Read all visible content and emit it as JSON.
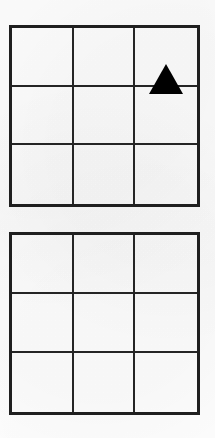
{
  "page": {
    "background_color": "#fefefe",
    "width": 215,
    "height": 438
  },
  "style": {
    "outer_border_color": "#1f1f1f",
    "inner_line_color": "#252525",
    "shape_color": "#000000",
    "outer_border_width": 3,
    "inner_line_width": 2
  },
  "grids": [
    {
      "name": "top-grid",
      "rows": 3,
      "cols": 3,
      "left": 9,
      "top": 25,
      "width": 191,
      "height": 182,
      "cells": [
        {
          "row": 0,
          "col": 0,
          "shape": null
        },
        {
          "row": 0,
          "col": 1,
          "shape": null
        },
        {
          "row": 0,
          "col": 2,
          "shape": "triangle"
        },
        {
          "row": 1,
          "col": 0,
          "shape": null
        },
        {
          "row": 1,
          "col": 1,
          "shape": null
        },
        {
          "row": 1,
          "col": 2,
          "shape": null
        },
        {
          "row": 2,
          "col": 0,
          "shape": null
        },
        {
          "row": 2,
          "col": 1,
          "shape": null
        },
        {
          "row": 2,
          "col": 2,
          "shape": null
        }
      ]
    },
    {
      "name": "bottom-grid",
      "rows": 3,
      "cols": 3,
      "left": 9,
      "top": 232,
      "width": 191,
      "height": 183,
      "cells": [
        {
          "row": 0,
          "col": 0,
          "shape": null
        },
        {
          "row": 0,
          "col": 1,
          "shape": null
        },
        {
          "row": 0,
          "col": 2,
          "shape": null
        },
        {
          "row": 1,
          "col": 0,
          "shape": null
        },
        {
          "row": 1,
          "col": 1,
          "shape": null
        },
        {
          "row": 1,
          "col": 2,
          "shape": null
        },
        {
          "row": 2,
          "col": 0,
          "shape": null
        },
        {
          "row": 2,
          "col": 1,
          "shape": null
        },
        {
          "row": 2,
          "col": 2,
          "shape": "circle"
        }
      ]
    }
  ],
  "shapes": {
    "triangle": {
      "label": "black-triangle",
      "size": 30,
      "fill": "#000000"
    },
    "circle": {
      "label": "black-circle",
      "size": 30,
      "fill": "#000000"
    }
  }
}
